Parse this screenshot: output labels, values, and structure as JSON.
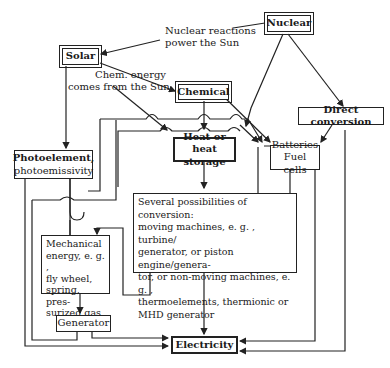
{
  "diagram": {
    "nodes": {
      "nuclear": "Nuclear",
      "solar": "Solar",
      "chemical": "Chemical",
      "direct_conversion": "Direct conversion",
      "photoelement": [
        "Photoelement,",
        "photoemissivity"
      ],
      "heat_storage": [
        "Heat or heat",
        "storage"
      ],
      "batteries": [
        "Batteries",
        "Fuel cells"
      ],
      "conversion": [
        "Several possibilities of conversion:",
        "moving machines, e. g. , turbine/",
        "generator, or piston engine/genera-",
        "tor, or non-moving machines, e. g. ,",
        "thermoelements, thermionic or",
        "MHD generator"
      ],
      "mechanical": [
        "Mechanical",
        "energy, e. g. ,",
        "fly wheel,",
        "spring, pres-",
        "surized gas"
      ],
      "generator": "Generator",
      "electricity": "Electricity"
    },
    "edge_labels": {
      "nuclear_solar": [
        "Nuclear reactions",
        "power the Sun"
      ],
      "solar_chemical": [
        "Chem. energy",
        "comes from the Sun"
      ]
    }
  }
}
